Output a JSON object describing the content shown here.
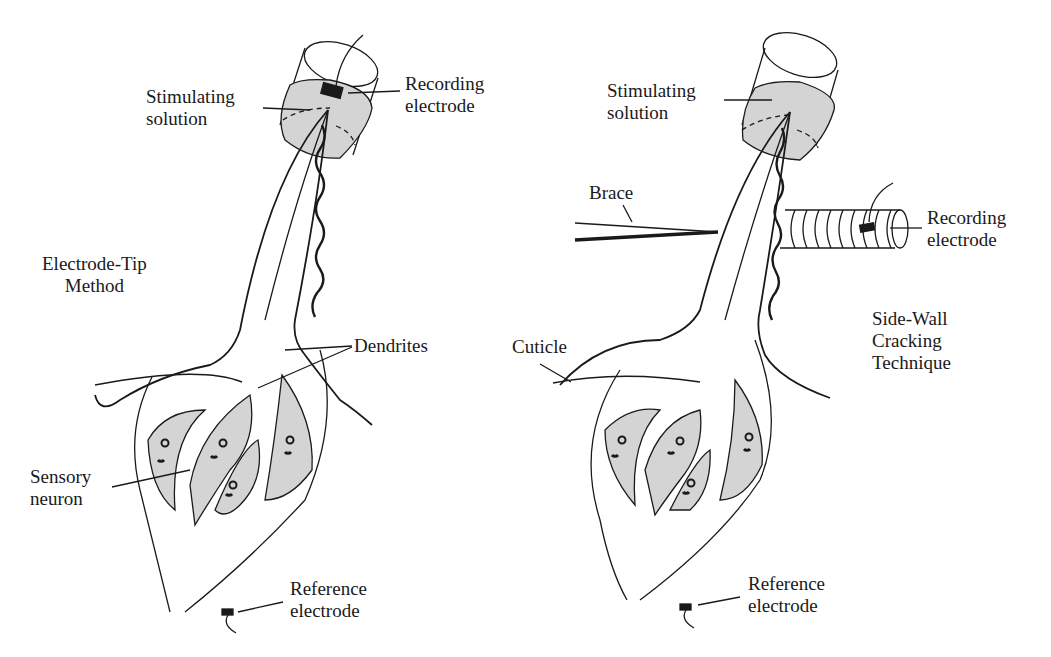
{
  "figure": {
    "left_panel": {
      "method_title": "Electrode-Tip\nMethod",
      "labels": {
        "stimulating_solution": "Stimulating\nsolution",
        "recording_electrode": "Recording\nelectrode",
        "dendrites": "Dendrites",
        "sensory_neuron": "Sensory\nneuron",
        "reference_electrode": "Reference\nelectrode"
      }
    },
    "right_panel": {
      "method_title": "Side-Wall\nCracking\nTechnique",
      "labels": {
        "stimulating_solution": "Stimulating\nsolution",
        "brace": "Brace",
        "recording_electrode": "Recording\nelectrode",
        "cuticle": "Cuticle",
        "reference_electrode": "Reference\nelectrode"
      }
    },
    "colors": {
      "ink": "#1a1a1a",
      "fill_gray": "#d4d4d4",
      "background": "#ffffff"
    }
  }
}
